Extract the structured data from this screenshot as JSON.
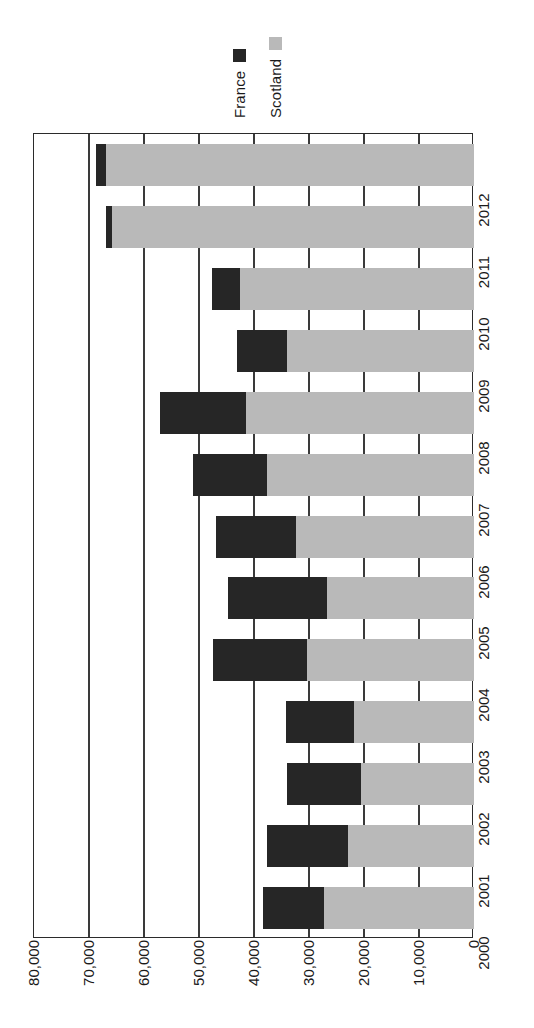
{
  "legend": {
    "position": "top",
    "entries": [
      {
        "label": "France",
        "color": "#262626",
        "swatch": "legend-swatch-france"
      },
      {
        "label": "Scotland",
        "color": "#b9b9b9",
        "swatch": "legend-swatch-scotland"
      }
    ]
  },
  "axis": {
    "value_ticks": [
      "80,000",
      "70,000",
      "60,000",
      "50,000",
      "40,000",
      "30,000",
      "20,000",
      "10,000",
      "0"
    ],
    "category_ticks": [
      "2012",
      "2011",
      "2010",
      "2009",
      "2008",
      "2007",
      "2006",
      "2005",
      "2004",
      "2003",
      "2002",
      "2001",
      "2000"
    ]
  },
  "chart_data": {
    "type": "bar",
    "orientation": "horizontal-stacked",
    "title": "",
    "subtitle": "",
    "xlabel": "",
    "ylabel": "",
    "xlim": [
      0,
      80000
    ],
    "xlim_direction": "reversed-right-to-left",
    "grid": true,
    "gridlines": [
      0,
      10000,
      20000,
      30000,
      40000,
      50000,
      60000,
      70000,
      80000
    ],
    "legend_position": "top",
    "categories": [
      "2012",
      "2011",
      "2010",
      "2009",
      "2008",
      "2007",
      "2006",
      "2005",
      "2004",
      "2003",
      "2002",
      "2001",
      "2000"
    ],
    "series": [
      {
        "name": "France",
        "color": "#262626",
        "values": [
          1800,
          1100,
          5100,
          9100,
          15600,
          13500,
          14500,
          18000,
          17100,
          12400,
          13500,
          14700,
          11100
        ]
      },
      {
        "name": "Scotland",
        "color": "#b9b9b9",
        "values": [
          66900,
          65900,
          42500,
          34000,
          41500,
          37600,
          32400,
          26700,
          30400,
          21800,
          20500,
          22900,
          27300
        ]
      }
    ],
    "totals": [
      68700,
      67000,
      47600,
      43100,
      57100,
      51100,
      46900,
      44700,
      47500,
      34200,
      34000,
      37600,
      38400
    ]
  }
}
